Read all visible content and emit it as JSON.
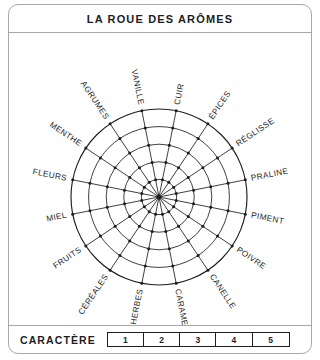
{
  "card": {
    "title": "LA ROUE DES ARÔMES"
  },
  "wheel": {
    "spoke_count": 16,
    "ring_count": 5,
    "center_x": 150,
    "center_y": 165,
    "outer_radius": 88,
    "angle_offset_deg": 11.25,
    "stroke_color": "#1d1d1f",
    "label_color": "#1d1d1f",
    "labels": [
      "CUIR",
      "ÉPICES",
      "RÉGLISSE",
      "PRALINE",
      "PIMENT",
      "POIVRE",
      "CANELLE",
      "CARAMEL",
      "HERBES",
      "CÉRÉALES",
      "FRUITS",
      "MIEL",
      "FLEURS",
      "MENTHE",
      "AGRUMES",
      "VANILLE"
    ]
  },
  "footer": {
    "label": "CARACTÈRE",
    "scale": [
      "1",
      "2",
      "3",
      "4",
      "5"
    ]
  }
}
